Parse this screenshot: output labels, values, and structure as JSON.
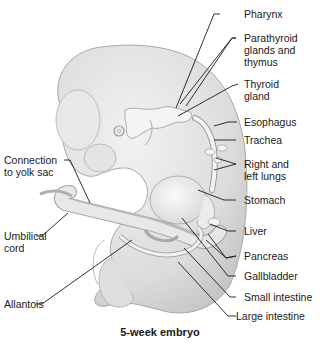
{
  "figure": {
    "caption": "5-week embryo"
  },
  "labels": {
    "pharynx": "Pharynx",
    "parathyroid": "Parathyroid\nglands and\nthymus",
    "thyroid": "Thyroid\ngland",
    "esophagus": "Esophagus",
    "trachea": "Trachea",
    "lungs": "Right and\nleft lungs",
    "stomach": "Stomach",
    "liver": "Liver",
    "pancreas": "Pancreas",
    "gallbladder": "Gallbladder",
    "small_intestine": "Small intestine",
    "large_intestine": "Large intestine",
    "yolk_sac": "Connection\nto yolk sac",
    "umbilical": "Umbilical\ncord",
    "allantois": "Allantois"
  },
  "colors": {
    "body_fill": "#e2e2e2",
    "body_shade": "#c8c8c8",
    "organ_fill": "#f3f3f3",
    "outline": "#9a9a9a",
    "leader": "#1a1a1a"
  }
}
